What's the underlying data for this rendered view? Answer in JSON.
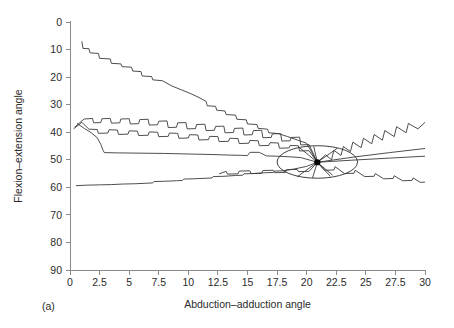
{
  "figure": {
    "panel_label": "(a)",
    "background_color": "#ffffff",
    "line_color": "#3a3a3a",
    "axis_color": "#8a8a8a",
    "focus_color": "#000000"
  },
  "chart_data": {
    "type": "line",
    "title": "",
    "xlabel": "Abduction–adduction angle",
    "ylabel": "Flexion–extension angle",
    "xlim": [
      0,
      30
    ],
    "ylim": [
      90,
      0
    ],
    "y_axis_inverted": true,
    "grid": false,
    "legend": "none",
    "xticks": [
      0,
      2.5,
      5,
      7.5,
      10,
      12.5,
      15,
      17.5,
      20,
      22.5,
      25,
      27.5,
      30
    ],
    "xtick_labels": [
      "0",
      "2.5",
      "5",
      "7.5",
      "10",
      "12.5",
      "15",
      "17.5",
      "20",
      "22.5",
      "25",
      "27.5",
      "30"
    ],
    "yticks": [
      0,
      10,
      20,
      30,
      40,
      50,
      60,
      70,
      80,
      90
    ],
    "ytick_labels": [
      "0",
      "10",
      "20",
      "30",
      "40",
      "50",
      "60",
      "70",
      "80",
      "90"
    ],
    "annotations": [
      {
        "kind": "ellipse",
        "name": "convergence-region",
        "cx": 20.9,
        "cy": 50.8,
        "rx": 3.4,
        "ry": 5.9
      },
      {
        "kind": "point",
        "name": "convergence-point",
        "x": 20.9,
        "y": 50.9
      }
    ],
    "series": [
      {
        "name": "trajectory-1",
        "values": [
          [
            1.0,
            7.0
          ],
          [
            1.1,
            9.6
          ],
          [
            1.6,
            9.7
          ],
          [
            1.7,
            11.2
          ],
          [
            2.4,
            11.4
          ],
          [
            2.5,
            13.2
          ],
          [
            3.4,
            13.4
          ],
          [
            3.5,
            15.0
          ],
          [
            4.3,
            15.2
          ],
          [
            4.4,
            16.2
          ],
          [
            5.2,
            16.4
          ],
          [
            5.3,
            17.8
          ],
          [
            6.0,
            18.0
          ],
          [
            6.1,
            19.6
          ],
          [
            6.9,
            19.8
          ],
          [
            7.0,
            21.0
          ],
          [
            7.8,
            21.3
          ],
          [
            8.6,
            23.2
          ],
          [
            9.4,
            24.6
          ],
          [
            10.2,
            26.0
          ],
          [
            10.9,
            27.4
          ],
          [
            11.5,
            28.8
          ],
          [
            11.6,
            30.4
          ],
          [
            12.3,
            30.6
          ],
          [
            12.4,
            32.0
          ],
          [
            13.1,
            32.3
          ],
          [
            13.2,
            33.6
          ],
          [
            14.0,
            33.8
          ],
          [
            14.1,
            35.3
          ],
          [
            14.9,
            35.5
          ],
          [
            15.0,
            37.0
          ],
          [
            15.8,
            37.2
          ],
          [
            15.9,
            38.6
          ],
          [
            16.7,
            38.9
          ],
          [
            16.8,
            40.2
          ],
          [
            17.6,
            40.5
          ],
          [
            18.4,
            41.6
          ],
          [
            19.2,
            42.8
          ],
          [
            20.0,
            44.0
          ],
          [
            20.9,
            50.9
          ]
        ]
      },
      {
        "name": "trajectory-2-sawtooth-upper",
        "values": [
          [
            0.4,
            38.2
          ],
          [
            0.8,
            36.6
          ],
          [
            1.2,
            35.2
          ],
          [
            1.9,
            35.0
          ],
          [
            2.0,
            36.6
          ],
          [
            2.6,
            36.5
          ],
          [
            2.7,
            35.1
          ],
          [
            3.4,
            35.0
          ],
          [
            3.5,
            36.7
          ],
          [
            4.2,
            36.6
          ],
          [
            4.3,
            35.2
          ],
          [
            5.0,
            35.1
          ],
          [
            5.1,
            37.0
          ],
          [
            5.8,
            36.9
          ],
          [
            5.9,
            35.4
          ],
          [
            6.6,
            35.3
          ],
          [
            6.7,
            37.4
          ],
          [
            7.4,
            37.3
          ],
          [
            7.5,
            36.0
          ],
          [
            8.2,
            35.9
          ],
          [
            8.3,
            38.3
          ],
          [
            9.0,
            38.2
          ],
          [
            9.1,
            36.6
          ],
          [
            9.8,
            36.5
          ],
          [
            9.9,
            38.8
          ],
          [
            10.6,
            38.7
          ],
          [
            10.7,
            37.2
          ],
          [
            11.4,
            37.1
          ],
          [
            11.5,
            39.4
          ],
          [
            12.2,
            39.3
          ],
          [
            12.3,
            37.9
          ],
          [
            13.0,
            37.8
          ],
          [
            13.1,
            40.2
          ],
          [
            13.8,
            40.1
          ],
          [
            13.9,
            38.6
          ],
          [
            14.6,
            38.5
          ],
          [
            14.7,
            41.0
          ],
          [
            15.4,
            40.9
          ],
          [
            15.5,
            39.4
          ],
          [
            16.2,
            39.3
          ],
          [
            16.3,
            42.0
          ],
          [
            17.0,
            41.9
          ],
          [
            17.1,
            40.6
          ],
          [
            17.8,
            40.5
          ],
          [
            17.9,
            43.2
          ],
          [
            18.6,
            43.1
          ],
          [
            18.7,
            41.9
          ],
          [
            19.4,
            41.8
          ],
          [
            19.5,
            44.6
          ],
          [
            20.2,
            44.5
          ],
          [
            20.9,
            50.9
          ]
        ]
      },
      {
        "name": "trajectory-3-sawtooth-lower",
        "values": [
          [
            0.3,
            38.8
          ],
          [
            1.0,
            36.4
          ],
          [
            1.6,
            38.9
          ],
          [
            2.3,
            39.0
          ],
          [
            2.4,
            40.4
          ],
          [
            3.2,
            40.3
          ],
          [
            3.3,
            39.1
          ],
          [
            4.0,
            39.2
          ],
          [
            4.1,
            40.8
          ],
          [
            4.9,
            40.7
          ],
          [
            5.0,
            39.5
          ],
          [
            5.7,
            39.6
          ],
          [
            5.8,
            41.2
          ],
          [
            6.6,
            41.1
          ],
          [
            6.7,
            39.9
          ],
          [
            7.4,
            40.0
          ],
          [
            7.5,
            41.6
          ],
          [
            8.3,
            41.5
          ],
          [
            8.4,
            40.3
          ],
          [
            9.1,
            40.4
          ],
          [
            9.2,
            42.2
          ],
          [
            10.0,
            42.1
          ],
          [
            10.1,
            40.9
          ],
          [
            10.8,
            41.0
          ],
          [
            10.9,
            42.8
          ],
          [
            11.7,
            42.7
          ],
          [
            11.8,
            41.5
          ],
          [
            12.5,
            41.6
          ],
          [
            12.6,
            43.4
          ],
          [
            13.4,
            43.3
          ],
          [
            13.5,
            42.2
          ],
          [
            14.2,
            42.3
          ],
          [
            14.3,
            44.1
          ],
          [
            15.1,
            44.0
          ],
          [
            15.2,
            43.0
          ],
          [
            15.9,
            43.1
          ],
          [
            16.0,
            44.9
          ],
          [
            16.8,
            44.8
          ],
          [
            16.9,
            43.8
          ],
          [
            17.6,
            43.9
          ],
          [
            17.7,
            45.8
          ],
          [
            18.5,
            45.7
          ],
          [
            18.6,
            44.8
          ],
          [
            19.3,
            44.9
          ],
          [
            19.4,
            46.8
          ],
          [
            20.2,
            46.7
          ],
          [
            20.9,
            50.9
          ]
        ]
      },
      {
        "name": "trajectory-4-plateau",
        "values": [
          [
            0.6,
            36.8
          ],
          [
            1.2,
            38.6
          ],
          [
            1.8,
            40.2
          ],
          [
            2.3,
            42.0
          ],
          [
            2.6,
            44.4
          ],
          [
            2.8,
            46.6
          ],
          [
            2.9,
            47.4
          ],
          [
            4.0,
            47.5
          ],
          [
            6.0,
            47.6
          ],
          [
            8.0,
            47.7
          ],
          [
            10.0,
            47.9
          ],
          [
            12.0,
            48.1
          ],
          [
            13.5,
            48.3
          ],
          [
            14.5,
            48.4
          ],
          [
            15.0,
            48.5
          ],
          [
            15.2,
            47.3
          ],
          [
            16.0,
            47.3
          ],
          [
            16.6,
            48.6
          ],
          [
            17.5,
            48.7
          ],
          [
            18.5,
            48.9
          ],
          [
            19.5,
            49.2
          ],
          [
            20.9,
            50.9
          ]
        ]
      },
      {
        "name": "trajectory-5-baseline",
        "values": [
          [
            0.5,
            59.4
          ],
          [
            1.5,
            59.2
          ],
          [
            2.5,
            59.1
          ],
          [
            3.5,
            59.0
          ],
          [
            4.5,
            58.8
          ],
          [
            5.5,
            58.7
          ],
          [
            6.5,
            58.5
          ],
          [
            7.0,
            58.4
          ],
          [
            7.1,
            57.9
          ],
          [
            8.0,
            57.8
          ],
          [
            9.0,
            57.6
          ],
          [
            9.5,
            57.5
          ],
          [
            9.6,
            57.0
          ],
          [
            10.5,
            56.9
          ],
          [
            11.5,
            56.7
          ],
          [
            12.0,
            56.6
          ],
          [
            12.1,
            56.1
          ],
          [
            13.0,
            56.0
          ],
          [
            14.0,
            55.7
          ],
          [
            14.6,
            55.6
          ],
          [
            14.7,
            55.1
          ],
          [
            15.5,
            55.0
          ],
          [
            16.5,
            54.7
          ],
          [
            17.2,
            54.6
          ],
          [
            17.3,
            54.1
          ],
          [
            18.0,
            54.0
          ],
          [
            19.0,
            53.3
          ],
          [
            20.0,
            52.4
          ],
          [
            20.9,
            50.9
          ]
        ]
      },
      {
        "name": "trajectory-6-short-lower",
        "values": [
          [
            12.6,
            55.1
          ],
          [
            13.2,
            54.2
          ],
          [
            13.3,
            55.2
          ],
          [
            14.2,
            55.1
          ],
          [
            14.3,
            54.1
          ],
          [
            15.2,
            54.0
          ],
          [
            15.3,
            55.0
          ],
          [
            16.2,
            54.9
          ],
          [
            16.3,
            53.9
          ],
          [
            17.2,
            53.8
          ],
          [
            17.3,
            54.7
          ],
          [
            18.2,
            54.6
          ],
          [
            18.3,
            53.6
          ],
          [
            19.2,
            53.5
          ],
          [
            19.3,
            54.3
          ],
          [
            20.2,
            54.2
          ],
          [
            20.9,
            50.9
          ]
        ]
      },
      {
        "name": "exit-1-sawtooth-up",
        "values": [
          [
            20.9,
            50.9
          ],
          [
            21.6,
            48.2
          ],
          [
            22.1,
            50.0
          ],
          [
            22.3,
            46.6
          ],
          [
            22.9,
            48.4
          ],
          [
            23.1,
            45.2
          ],
          [
            23.7,
            47.0
          ],
          [
            23.9,
            43.6
          ],
          [
            24.6,
            45.6
          ],
          [
            24.8,
            42.2
          ],
          [
            25.5,
            44.2
          ],
          [
            25.7,
            40.8
          ],
          [
            26.4,
            42.9
          ],
          [
            26.6,
            39.4
          ],
          [
            27.4,
            41.6
          ],
          [
            27.6,
            38.0
          ],
          [
            28.4,
            40.2
          ],
          [
            28.6,
            36.8
          ],
          [
            29.4,
            38.8
          ],
          [
            30.0,
            36.4
          ]
        ]
      },
      {
        "name": "exit-2-straight-upper",
        "values": [
          [
            20.9,
            50.9
          ],
          [
            24.0,
            49.0
          ],
          [
            27.0,
            47.4
          ],
          [
            30.0,
            45.9
          ]
        ]
      },
      {
        "name": "exit-3-straight-middle",
        "values": [
          [
            20.9,
            50.9
          ],
          [
            24.0,
            50.1
          ],
          [
            27.0,
            49.4
          ],
          [
            30.0,
            48.7
          ]
        ]
      },
      {
        "name": "exit-4-sawtooth-down",
        "values": [
          [
            20.9,
            50.9
          ],
          [
            21.5,
            53.8
          ],
          [
            22.3,
            53.7
          ],
          [
            22.4,
            52.5
          ],
          [
            23.2,
            55.0
          ],
          [
            24.0,
            54.9
          ],
          [
            24.1,
            53.8
          ],
          [
            24.9,
            56.1
          ],
          [
            25.7,
            56.0
          ],
          [
            25.8,
            55.0
          ],
          [
            26.5,
            56.9
          ],
          [
            27.3,
            56.8
          ],
          [
            27.4,
            55.8
          ],
          [
            28.1,
            57.6
          ],
          [
            28.9,
            57.5
          ],
          [
            29.0,
            56.6
          ],
          [
            29.6,
            58.2
          ],
          [
            30.0,
            58.1
          ]
        ]
      },
      {
        "name": "exit-5-radial-short-up",
        "values": [
          [
            20.9,
            50.9
          ],
          [
            22.6,
            45.8
          ]
        ]
      },
      {
        "name": "exit-6-radial-short-down",
        "values": [
          [
            20.9,
            50.9
          ],
          [
            22.2,
            55.6
          ]
        ]
      },
      {
        "name": "entry-radial-up-a",
        "values": [
          [
            20.9,
            50.9
          ],
          [
            19.4,
            45.6
          ]
        ]
      },
      {
        "name": "entry-radial-up-b",
        "values": [
          [
            20.9,
            50.9
          ],
          [
            20.6,
            45.2
          ]
        ]
      },
      {
        "name": "entry-radial-down-a",
        "values": [
          [
            20.9,
            50.9
          ],
          [
            19.2,
            56.2
          ]
        ]
      },
      {
        "name": "entry-radial-down-b",
        "values": [
          [
            20.9,
            50.9
          ],
          [
            20.5,
            56.6
          ]
        ]
      },
      {
        "name": "entry-radial-down-c",
        "values": [
          [
            20.9,
            50.9
          ],
          [
            22.0,
            56.0
          ]
        ]
      }
    ]
  }
}
